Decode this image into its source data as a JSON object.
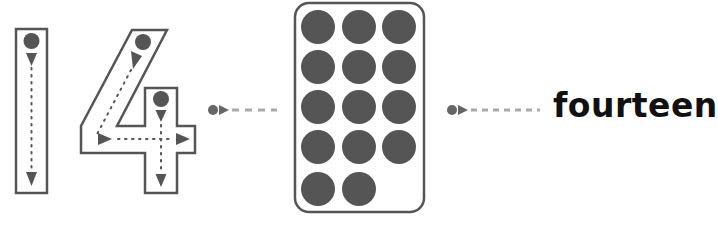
{
  "numeral": {
    "value": "14",
    "digits": [
      "1",
      "4"
    ],
    "outline_color": "#555555",
    "guide_color": "#555555"
  },
  "counters": {
    "count": 14,
    "columns": 3,
    "rows": [
      3,
      3,
      3,
      3,
      2
    ],
    "dot_color": "#555555",
    "frame_color": "#555555"
  },
  "word": {
    "label": "fourteen",
    "color": "#111111"
  },
  "connectors": {
    "dot_color": "#666666",
    "dash_color": "#aaaaaa"
  }
}
